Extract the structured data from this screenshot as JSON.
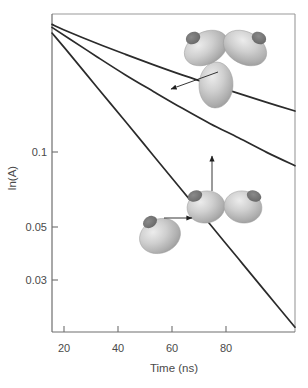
{
  "chart_data": {
    "type": "line",
    "title": "",
    "subtitle": "",
    "xlabel": "Time (ns)",
    "ylabel": "ln(A)",
    "yscale": "log",
    "xscale": "linear",
    "grid": false,
    "legend": null,
    "xlim": [
      14,
      100
    ],
    "ylim": [
      0.02,
      0.27
    ],
    "xticks": [
      20,
      40,
      60,
      80
    ],
    "xtick_labels": [
      "20",
      "40",
      "60",
      "80"
    ],
    "yticks": [
      0.1,
      0.05,
      0.03
    ],
    "ytick_labels": [
      "0.1",
      "0.05",
      "0.03"
    ],
    "series": [
      {
        "name": "trimer",
        "annotation": "trimer",
        "x": [
          14,
          20,
          30,
          40,
          50,
          60,
          70,
          80,
          90,
          100
        ],
        "y": [
          0.248,
          0.233,
          0.212,
          0.194,
          0.178,
          0.164,
          0.152,
          0.141,
          0.131,
          0.122
        ]
      },
      {
        "name": "dimer",
        "annotation": "dimer",
        "x": [
          14,
          20,
          30,
          40,
          50,
          60,
          70,
          80,
          90,
          100
        ],
        "y": [
          0.242,
          0.221,
          0.19,
          0.164,
          0.143,
          0.125,
          0.11,
          0.098,
          0.087,
          0.078
        ]
      },
      {
        "name": "monomer",
        "annotation": "monomer",
        "x": [
          14,
          20,
          30,
          40,
          50,
          60,
          70,
          80,
          90,
          100
        ],
        "y": [
          0.231,
          0.196,
          0.148,
          0.112,
          0.0845,
          0.0638,
          0.0482,
          0.0364,
          0.0275,
          0.0208
        ]
      }
    ],
    "annotations": [
      {
        "name": "trimer-callout",
        "icon": "trimer-ellipsoid-cluster",
        "arrow_from": [
          218,
          72
        ],
        "arrow_to": [
          169,
          90
        ],
        "points_to_series": "trimer"
      },
      {
        "name": "dimer-callout",
        "icon": "dimer-ellipsoid-cluster",
        "arrow_from": [
          212,
          191
        ],
        "arrow_to": [
          212,
          156
        ],
        "points_to_series": "dimer"
      },
      {
        "name": "monomer-callout",
        "icon": "monomer-ellipsoid",
        "arrow_from": [
          163,
          218
        ],
        "arrow_to": [
          191,
          218
        ],
        "points_to_series": "monomer"
      }
    ]
  },
  "style": {
    "curve_color": "#2b2b2b",
    "axis_color": "#8c8c8c",
    "text_color": "#4a4a4a",
    "background": "#ffffff",
    "ellipsoid_light": "#e2e2e2",
    "ellipsoid_mid": "#b2b2b2",
    "ellipsoid_dark": "#8f8f8f",
    "spot_color": "#6e6e6e",
    "arrow_color": "#1f1f1f"
  },
  "axes": {
    "frame": {
      "left": 52,
      "top": 14,
      "right": 295,
      "bottom": 332
    },
    "ylabel_text": "ln(A)",
    "xlabel_text": "Time (ns)"
  }
}
